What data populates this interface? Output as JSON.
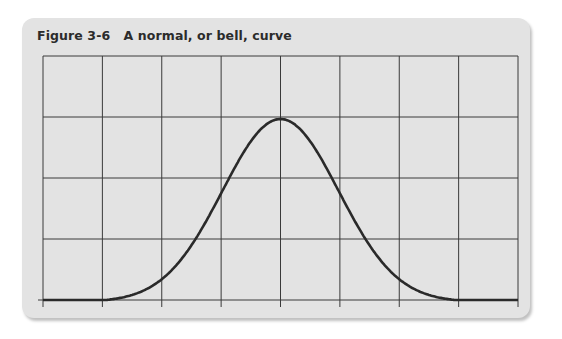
{
  "figure": {
    "title": "Figure 3-6   A normal, or bell, curve"
  },
  "chart_data": {
    "type": "line",
    "title": "Figure 3-6 A normal, or bell, curve",
    "xlabel": "",
    "ylabel": "",
    "grid": true,
    "grid_columns": 8,
    "grid_rows": 4,
    "x_range": [
      0,
      8
    ],
    "y_range": [
      0,
      4
    ],
    "curve": "normal distribution",
    "mean": 4,
    "std_dev": 1,
    "peak_value": 3,
    "x": [
      0,
      1,
      1.5,
      2,
      2.5,
      3,
      3.5,
      4,
      4.5,
      5,
      5.5,
      6,
      6.5,
      7,
      8
    ],
    "values": [
      0,
      0,
      0.17,
      0.41,
      0.97,
      1.82,
      2.65,
      3.0,
      2.65,
      1.82,
      0.97,
      0.41,
      0.17,
      0,
      0
    ],
    "line_color": "#2a2a2a",
    "background": "#e3e3e3"
  }
}
